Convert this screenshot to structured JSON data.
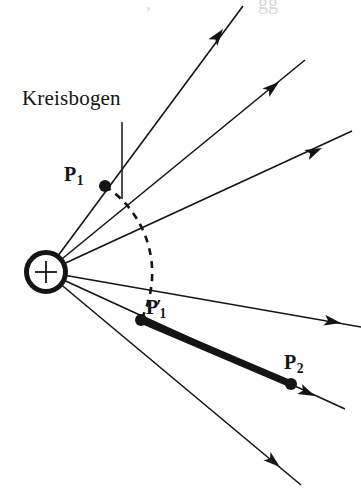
{
  "figure": {
    "width": 361,
    "height": 496,
    "background": "#ffffff",
    "ink_color": "#141414"
  },
  "labels": {
    "kreisbogen": "Kreisbogen",
    "p1_base": "P",
    "p1_sub": "1",
    "p1_prime_base": "P",
    "p1_prime_mark": "′",
    "p1_prime_sub": "1",
    "p2_base": "P",
    "p2_sub": "2"
  },
  "ghost_text": {
    "left_fragment": ",",
    "right_fragment": "gg"
  },
  "source": {
    "name": "positive charge source",
    "symbol": "+",
    "center_x": 46,
    "center_y": 272,
    "outer_radius": 22,
    "ring_width": 5,
    "cross_arm": 11
  },
  "points": [
    {
      "name": "P1",
      "x": 105,
      "y": 186,
      "radius": 6
    },
    {
      "name": "P1prime",
      "x": 141,
      "y": 320,
      "radius": 6
    },
    {
      "name": "P2",
      "x": 291,
      "y": 384,
      "radius": 6
    }
  ],
  "rays": [
    {
      "name": "ray-1",
      "x1": 46,
      "y1": 272,
      "x2": 243,
      "y2": 6,
      "arrow_x": 222,
      "arrow_y": 31,
      "arrow_angle": -53.4
    },
    {
      "name": "ray-2",
      "x1": 46,
      "y1": 272,
      "x2": 305,
      "y2": 60,
      "arrow_x": 277,
      "arrow_y": 83,
      "arrow_angle": -39.3
    },
    {
      "name": "ray-3",
      "x1": 46,
      "y1": 272,
      "x2": 352,
      "y2": 131,
      "arrow_x": 318,
      "arrow_y": 147,
      "arrow_angle": -24.7
    },
    {
      "name": "ray-4",
      "x1": 46,
      "y1": 272,
      "x2": 361,
      "y2": 327,
      "arrow_x": 337,
      "arrow_y": 322,
      "arrow_angle": 9.9
    },
    {
      "name": "ray-5",
      "x1": 46,
      "y1": 272,
      "x2": 345,
      "y2": 409,
      "arrow_x": 311,
      "arrow_y": 394,
      "arrow_angle": 24.6
    },
    {
      "name": "ray-6",
      "x1": 46,
      "y1": 272,
      "x2": 301,
      "y2": 485,
      "arrow_x": 276,
      "arrow_y": 464,
      "arrow_angle": 39.9
    }
  ],
  "arc": {
    "name": "Kreisbogen arc",
    "style": "dashed",
    "start_x": 105,
    "start_y": 186,
    "end_x": 141,
    "end_y": 320,
    "radius": 104,
    "dash_pattern": "7,6"
  },
  "leader_line": {
    "name": "kreisbogen leader",
    "x1": 122,
    "y1": 122,
    "x2": 122,
    "y2": 199
  },
  "chord": {
    "name": "thick chord P1prime to P2",
    "x1": 141,
    "y1": 320,
    "x2": 291,
    "y2": 384,
    "stroke_width": 7
  }
}
